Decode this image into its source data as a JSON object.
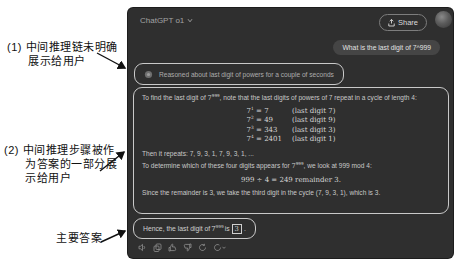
{
  "annotations": {
    "note1": {
      "line1": "(1) 中间推理链未明确",
      "line2": "展示给用户"
    },
    "note2": {
      "line1": "(2) 中间推理步骤被作",
      "line2": "为答案的一部分展",
      "line3": "示给用户"
    },
    "note3": "主要答案"
  },
  "window": {
    "header": {
      "title": "ChatGPT o1",
      "share_label": "Share"
    },
    "user_message": "What is the last digit of 7^999",
    "reasoning_summary": "Reasoned about last digit of powers for a couple of seconds",
    "answer": {
      "p1_prefix": "To find the last digit of ",
      "p1_math_base": "7",
      "p1_math_exp": "999",
      "p1_suffix": ", note that the last digits of powers of 7 repeat in a cycle of length 4:",
      "cycle_equations": [
        {
          "base": "7",
          "exp": "1",
          "value": "= 7",
          "note": "(last digit 7)"
        },
        {
          "base": "7",
          "exp": "2",
          "value": "= 49",
          "note": "(last digit 9)"
        },
        {
          "base": "7",
          "exp": "3",
          "value": "= 343",
          "note": "(last digit 3)"
        },
        {
          "base": "7",
          "exp": "4",
          "value": "= 2401",
          "note": "(last digit 1)"
        }
      ],
      "p2": "Then it repeats: 7, 9, 3, 1, 7, 9, 3, 1, ...",
      "p3_prefix": "To determine which of these four digits appears for ",
      "p3_math_base": "7",
      "p3_math_exp": "999",
      "p3_suffix": ", we look at 999 mod 4:",
      "mod_equation": "999 ÷ 4 = 249 remainder 3.",
      "p4": "Since the remainder is 3, we take the third digit in the cycle (7, 9, 3, 1), which is 3.",
      "final_prefix": "Hence, the last digit of ",
      "final_math_base": "7",
      "final_math_exp": "999",
      "final_mid": " is ",
      "final_answer": "3",
      "final_suffix": "."
    },
    "action_icons": [
      "read-aloud",
      "copy",
      "thumbs-up",
      "thumbs-down",
      "regenerate",
      "switch-model"
    ]
  },
  "colors": {
    "window_bg": "#2f2f2f",
    "user_bubble_bg": "#454545",
    "text_primary": "#d6d6d6",
    "text_secondary": "#a8a8a8",
    "highlight_border": "#c9c9c9",
    "annotation_text": "#111111"
  }
}
